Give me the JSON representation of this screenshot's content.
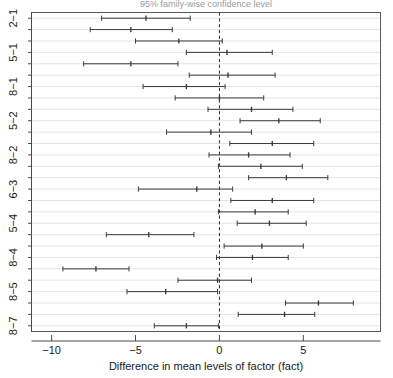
{
  "chart_data": {
    "type": "scatter",
    "subtype": "confidence-interval-dotplot",
    "title": "95% family-wise confidence level",
    "xlabel": "Difference in mean levels of factor (fact)",
    "ylabel": "",
    "xlim": [
      -11.2,
      9.6
    ],
    "ylim": [
      0,
      28
    ],
    "grid": true,
    "gridaxis": "y",
    "legend": false,
    "xticks": [
      -10,
      -5,
      0,
      5
    ],
    "xticklabels": [
      "−10",
      "−5",
      "0",
      "5"
    ],
    "reference_line": {
      "x": 0,
      "style": "dashed"
    },
    "yticklabels": [
      "2−1",
      "5−1",
      "8−1",
      "5−2",
      "8−2",
      "6−3",
      "5−4",
      "8−4",
      "8−5",
      "8−7"
    ],
    "ytick_rows": [
      1,
      4,
      7,
      10,
      13,
      16,
      19,
      22,
      25,
      28
    ],
    "series_name": "Tukey HSD pairwise differences",
    "points": [
      {
        "row": 1,
        "lower": -7.02,
        "center": -4.38,
        "upper": -1.74
      },
      {
        "row": 2,
        "lower": -7.7,
        "center": -5.28,
        "upper": -2.81
      },
      {
        "row": 3,
        "lower": -5.0,
        "center": -2.42,
        "upper": 0.17
      },
      {
        "row": 4,
        "lower": -1.97,
        "center": 0.45,
        "upper": 3.15
      },
      {
        "row": 5,
        "lower": -8.09,
        "center": -5.28,
        "upper": -2.47
      },
      {
        "row": 6,
        "lower": -1.8,
        "center": 0.51,
        "upper": 3.32
      },
      {
        "row": 7,
        "lower": -4.55,
        "center": -1.97,
        "upper": 0.34
      },
      {
        "row": 8,
        "lower": -2.64,
        "center": 0.0,
        "upper": 2.64
      },
      {
        "row": 9,
        "lower": -0.68,
        "center": 1.91,
        "upper": 4.38
      },
      {
        "row": 10,
        "lower": 1.23,
        "center": 3.54,
        "upper": 6.01
      },
      {
        "row": 11,
        "lower": -3.15,
        "center": -0.51,
        "upper": 1.91
      },
      {
        "row": 12,
        "lower": 0.62,
        "center": 3.15,
        "upper": 5.62
      },
      {
        "row": 13,
        "lower": -0.62,
        "center": 1.74,
        "upper": 4.21
      },
      {
        "row": 14,
        "lower": -0.06,
        "center": 2.47,
        "upper": 4.94
      },
      {
        "row": 15,
        "lower": 1.74,
        "center": 3.99,
        "upper": 6.46
      },
      {
        "row": 16,
        "lower": -4.83,
        "center": -1.35,
        "upper": 0.79
      },
      {
        "row": 17,
        "lower": 0.68,
        "center": 3.15,
        "upper": 5.62
      },
      {
        "row": 18,
        "lower": -0.06,
        "center": 2.13,
        "upper": 4.1
      },
      {
        "row": 19,
        "lower": 1.06,
        "center": 2.98,
        "upper": 5.17
      },
      {
        "row": 20,
        "lower": -6.74,
        "center": -4.21,
        "upper": -1.52
      },
      {
        "row": 21,
        "lower": 0.28,
        "center": 2.53,
        "upper": 5.0
      },
      {
        "row": 22,
        "lower": -0.17,
        "center": 1.97,
        "upper": 4.1
      },
      {
        "row": 23,
        "lower": -9.33,
        "center": -7.36,
        "upper": -5.39
      },
      {
        "row": 24,
        "lower": -2.47,
        "center": -0.11,
        "upper": 1.91
      },
      {
        "row": 25,
        "lower": -5.51,
        "center": -3.2,
        "upper": -0.11
      },
      {
        "row": 26,
        "lower": 3.94,
        "center": 5.9,
        "upper": 7.98
      },
      {
        "row": 27,
        "lower": 1.12,
        "center": 3.88,
        "upper": 5.68
      },
      {
        "row": 28,
        "lower": -3.88,
        "center": -1.97,
        "upper": -0.06
      }
    ]
  },
  "axes": {
    "x_title": "Difference in mean levels of factor (fact)",
    "x_tick_labels": [
      "−10",
      "−5",
      "0",
      "5"
    ],
    "y_tick_labels": [
      "2−1",
      "5−1",
      "8−1",
      "5−2",
      "8−2",
      "6−3",
      "5−4",
      "8−4",
      "8−5",
      "8−7"
    ]
  },
  "colors": {
    "line": "#3b3b3b",
    "grid": "#d8d8d8",
    "frame": "#5a5a5a",
    "zero": "#2b2b2b",
    "background": "#ffffff"
  }
}
